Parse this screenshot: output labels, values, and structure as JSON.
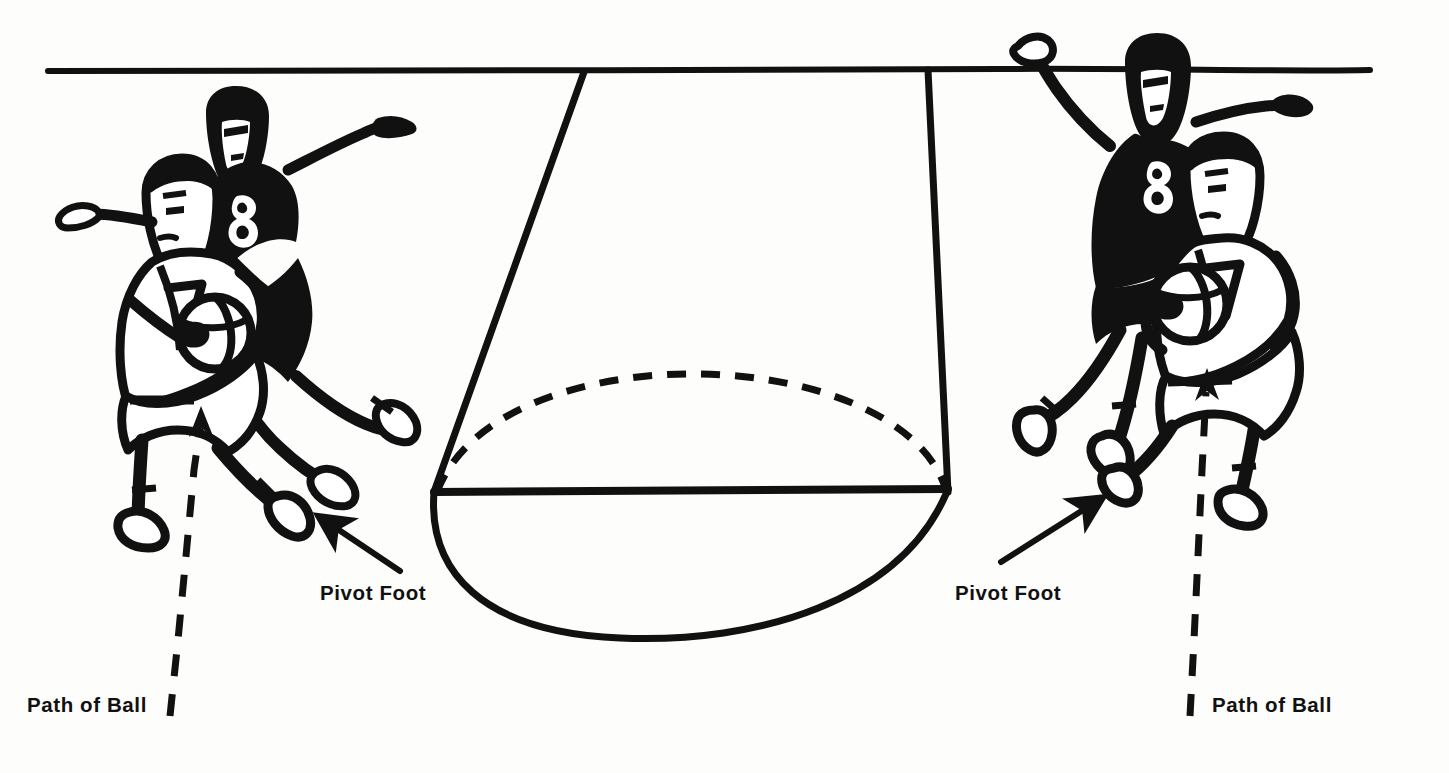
{
  "figure": {
    "type": "instructional-line-drawing",
    "background_color": "#fdfdfb",
    "ink_color": "#111111",
    "floor_line": "horizontal court line across top of figure"
  },
  "labels": {
    "pivot_foot_left": "Pivot Foot",
    "pivot_foot_right": "Pivot Foot",
    "path_of_ball_left": "Path of Ball",
    "path_of_ball_right": "Path of Ball"
  },
  "jerseys": {
    "defender_left_number": "8",
    "offense_left_number": "7",
    "defender_right_number": "8",
    "offense_right_number": "7"
  },
  "annotations": {
    "left_arrow_target": "pivot foot of left offensive player",
    "right_arrow_target": "pivot foot of right offensive player",
    "left_dashed_line": "vertical dashed line with upward arrowhead showing path of ball",
    "right_dashed_line": "vertical dashed line with upward arrowhead showing path of ball",
    "center_shape": "cylinder of pivot space, dashed hidden ellipse edge"
  }
}
